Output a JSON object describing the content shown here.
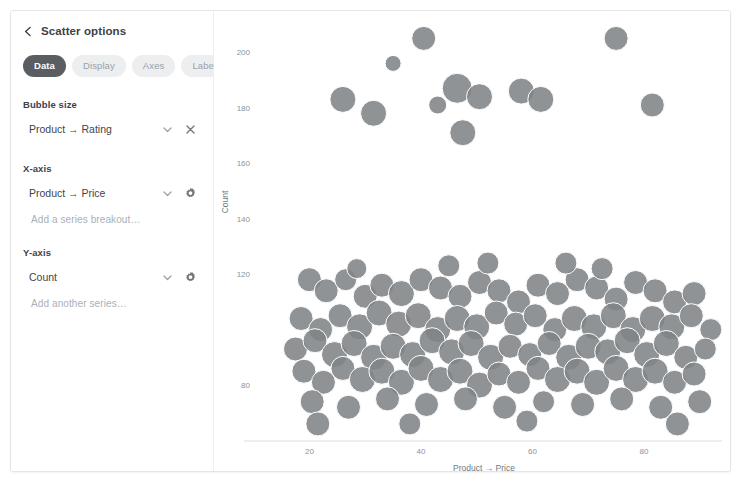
{
  "panel": {
    "back_icon": "chevron-left-icon",
    "title": "Scatter options",
    "tabs": [
      {
        "label": "Data",
        "active": true
      },
      {
        "label": "Display",
        "active": false
      },
      {
        "label": "Axes",
        "active": false
      },
      {
        "label": "Labels",
        "active": false
      }
    ],
    "fields": [
      {
        "label": "Bubble size",
        "value": "Product → Rating",
        "icons": [
          "chevron-down-icon",
          "close-icon"
        ]
      },
      {
        "label": "X-axis",
        "value": "Product → Price",
        "icons": [
          "chevron-down-icon",
          "gear-icon"
        ],
        "ghost": "Add a series breakout…"
      },
      {
        "label": "Y-axis",
        "value": "Count",
        "icons": [
          "chevron-down-icon",
          "gear-icon"
        ],
        "ghost": "Add another series…"
      }
    ],
    "colors": {
      "tab_active_bg": "#5a5d61",
      "tab_inactive_bg": "#eceef0",
      "text": "#3d4349",
      "muted": "#a9b0b7"
    }
  },
  "chart_data": {
    "type": "scatter",
    "title": "",
    "xlabel": "Product → Price",
    "ylabel": "Count",
    "bubble_size_field": "Product → Rating",
    "grid": false,
    "legend": "none",
    "marker_color": "#808487",
    "xlim": [
      14,
      94
    ],
    "ylim": [
      62,
      212
    ],
    "xticks": [
      20,
      40,
      60,
      80
    ],
    "yticks": [
      80,
      120,
      140,
      160,
      180,
      200
    ],
    "points": [
      {
        "x": 40.5,
        "y": 205,
        "r": 12
      },
      {
        "x": 75.0,
        "y": 205,
        "r": 12
      },
      {
        "x": 35.0,
        "y": 196,
        "r": 8
      },
      {
        "x": 46.5,
        "y": 187,
        "r": 15
      },
      {
        "x": 50.5,
        "y": 184,
        "r": 13
      },
      {
        "x": 58.0,
        "y": 186,
        "r": 13
      },
      {
        "x": 61.5,
        "y": 183,
        "r": 13
      },
      {
        "x": 26.0,
        "y": 183,
        "r": 13
      },
      {
        "x": 31.5,
        "y": 178,
        "r": 13
      },
      {
        "x": 43.0,
        "y": 181,
        "r": 9
      },
      {
        "x": 81.5,
        "y": 181,
        "r": 12
      },
      {
        "x": 47.5,
        "y": 171,
        "r": 13
      },
      {
        "x": 20.0,
        "y": 118,
        "r": 12
      },
      {
        "x": 23.0,
        "y": 114,
        "r": 12
      },
      {
        "x": 26.5,
        "y": 118,
        "r": 11
      },
      {
        "x": 30.0,
        "y": 112,
        "r": 12
      },
      {
        "x": 33.0,
        "y": 116,
        "r": 12
      },
      {
        "x": 36.5,
        "y": 113,
        "r": 13
      },
      {
        "x": 40.0,
        "y": 118,
        "r": 12
      },
      {
        "x": 43.5,
        "y": 115,
        "r": 12
      },
      {
        "x": 47.0,
        "y": 112,
        "r": 12
      },
      {
        "x": 50.5,
        "y": 117,
        "r": 12
      },
      {
        "x": 54.0,
        "y": 114,
        "r": 12
      },
      {
        "x": 57.5,
        "y": 110,
        "r": 12
      },
      {
        "x": 61.0,
        "y": 116,
        "r": 12
      },
      {
        "x": 64.5,
        "y": 113,
        "r": 12
      },
      {
        "x": 68.0,
        "y": 118,
        "r": 12
      },
      {
        "x": 71.5,
        "y": 115,
        "r": 12
      },
      {
        "x": 75.0,
        "y": 111,
        "r": 12
      },
      {
        "x": 78.5,
        "y": 117,
        "r": 12
      },
      {
        "x": 82.0,
        "y": 114,
        "r": 12
      },
      {
        "x": 85.5,
        "y": 110,
        "r": 12
      },
      {
        "x": 89.0,
        "y": 113,
        "r": 12
      },
      {
        "x": 18.5,
        "y": 104,
        "r": 12
      },
      {
        "x": 22.0,
        "y": 100,
        "r": 12
      },
      {
        "x": 25.5,
        "y": 105,
        "r": 12
      },
      {
        "x": 29.0,
        "y": 101,
        "r": 13
      },
      {
        "x": 32.5,
        "y": 106,
        "r": 13
      },
      {
        "x": 36.0,
        "y": 102,
        "r": 13
      },
      {
        "x": 39.5,
        "y": 105,
        "r": 13
      },
      {
        "x": 43.0,
        "y": 100,
        "r": 13
      },
      {
        "x": 46.5,
        "y": 104,
        "r": 13
      },
      {
        "x": 50.0,
        "y": 101,
        "r": 13
      },
      {
        "x": 53.5,
        "y": 106,
        "r": 12
      },
      {
        "x": 57.0,
        "y": 102,
        "r": 12
      },
      {
        "x": 60.5,
        "y": 105,
        "r": 12
      },
      {
        "x": 64.0,
        "y": 100,
        "r": 12
      },
      {
        "x": 67.5,
        "y": 104,
        "r": 13
      },
      {
        "x": 71.0,
        "y": 101,
        "r": 13
      },
      {
        "x": 74.5,
        "y": 105,
        "r": 13
      },
      {
        "x": 78.0,
        "y": 100,
        "r": 13
      },
      {
        "x": 81.5,
        "y": 104,
        "r": 13
      },
      {
        "x": 85.0,
        "y": 101,
        "r": 13
      },
      {
        "x": 88.5,
        "y": 105,
        "r": 12
      },
      {
        "x": 92.0,
        "y": 100,
        "r": 11
      },
      {
        "x": 17.5,
        "y": 93,
        "r": 12
      },
      {
        "x": 21.0,
        "y": 96,
        "r": 12
      },
      {
        "x": 24.5,
        "y": 91,
        "r": 13
      },
      {
        "x": 28.0,
        "y": 95,
        "r": 13
      },
      {
        "x": 31.5,
        "y": 90,
        "r": 13
      },
      {
        "x": 35.0,
        "y": 94,
        "r": 13
      },
      {
        "x": 38.5,
        "y": 91,
        "r": 13
      },
      {
        "x": 42.0,
        "y": 96,
        "r": 13
      },
      {
        "x": 45.5,
        "y": 92,
        "r": 13
      },
      {
        "x": 49.0,
        "y": 95,
        "r": 13
      },
      {
        "x": 52.5,
        "y": 90,
        "r": 13
      },
      {
        "x": 56.0,
        "y": 94,
        "r": 12
      },
      {
        "x": 59.5,
        "y": 91,
        "r": 12
      },
      {
        "x": 63.0,
        "y": 95,
        "r": 12
      },
      {
        "x": 66.5,
        "y": 90,
        "r": 13
      },
      {
        "x": 70.0,
        "y": 94,
        "r": 13
      },
      {
        "x": 73.5,
        "y": 92,
        "r": 13
      },
      {
        "x": 77.0,
        "y": 96,
        "r": 13
      },
      {
        "x": 80.5,
        "y": 91,
        "r": 13
      },
      {
        "x": 84.0,
        "y": 95,
        "r": 13
      },
      {
        "x": 87.5,
        "y": 90,
        "r": 12
      },
      {
        "x": 91.0,
        "y": 93,
        "r": 11
      },
      {
        "x": 19.0,
        "y": 85,
        "r": 12
      },
      {
        "x": 22.5,
        "y": 81,
        "r": 12
      },
      {
        "x": 26.0,
        "y": 86,
        "r": 12
      },
      {
        "x": 29.5,
        "y": 82,
        "r": 13
      },
      {
        "x": 33.0,
        "y": 85,
        "r": 13
      },
      {
        "x": 36.5,
        "y": 81,
        "r": 13
      },
      {
        "x": 40.0,
        "y": 86,
        "r": 13
      },
      {
        "x": 43.5,
        "y": 82,
        "r": 13
      },
      {
        "x": 47.0,
        "y": 85,
        "r": 13
      },
      {
        "x": 50.5,
        "y": 80,
        "r": 13
      },
      {
        "x": 54.0,
        "y": 84,
        "r": 12
      },
      {
        "x": 57.5,
        "y": 81,
        "r": 12
      },
      {
        "x": 61.0,
        "y": 86,
        "r": 12
      },
      {
        "x": 64.5,
        "y": 82,
        "r": 13
      },
      {
        "x": 68.0,
        "y": 85,
        "r": 13
      },
      {
        "x": 71.5,
        "y": 81,
        "r": 13
      },
      {
        "x": 75.0,
        "y": 86,
        "r": 13
      },
      {
        "x": 78.5,
        "y": 82,
        "r": 13
      },
      {
        "x": 82.0,
        "y": 85,
        "r": 13
      },
      {
        "x": 85.5,
        "y": 81,
        "r": 12
      },
      {
        "x": 89.0,
        "y": 84,
        "r": 12
      },
      {
        "x": 20.5,
        "y": 74,
        "r": 12
      },
      {
        "x": 27.0,
        "y": 72,
        "r": 12
      },
      {
        "x": 34.0,
        "y": 75,
        "r": 12
      },
      {
        "x": 41.0,
        "y": 73,
        "r": 12
      },
      {
        "x": 48.0,
        "y": 75,
        "r": 12
      },
      {
        "x": 55.0,
        "y": 72,
        "r": 12
      },
      {
        "x": 62.0,
        "y": 74,
        "r": 11
      },
      {
        "x": 69.0,
        "y": 73,
        "r": 12
      },
      {
        "x": 76.0,
        "y": 75,
        "r": 12
      },
      {
        "x": 83.0,
        "y": 72,
        "r": 12
      },
      {
        "x": 90.0,
        "y": 74,
        "r": 12
      },
      {
        "x": 21.5,
        "y": 66,
        "r": 12
      },
      {
        "x": 38.0,
        "y": 66,
        "r": 11
      },
      {
        "x": 59.0,
        "y": 67,
        "r": 11
      },
      {
        "x": 86.0,
        "y": 66,
        "r": 12
      },
      {
        "x": 45.0,
        "y": 123,
        "r": 11
      },
      {
        "x": 52.0,
        "y": 124,
        "r": 11
      },
      {
        "x": 66.0,
        "y": 124,
        "r": 11
      },
      {
        "x": 72.5,
        "y": 122,
        "r": 11
      },
      {
        "x": 28.5,
        "y": 122,
        "r": 10
      }
    ]
  }
}
